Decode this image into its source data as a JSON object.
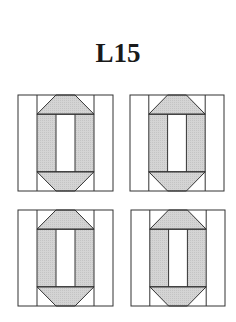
{
  "title": "L15",
  "diagram": {
    "colors": {
      "background": "#ffffff",
      "outline": "#333333",
      "fill": "#d0d0d0"
    },
    "blocks": [
      {
        "name": "block-top-left",
        "x": 18,
        "y": 95,
        "w": 95,
        "h": 96
      },
      {
        "name": "block-top-right",
        "x": 130,
        "y": 95,
        "w": 94,
        "h": 96
      },
      {
        "name": "block-bottom-left",
        "x": 18,
        "y": 210,
        "w": 95,
        "h": 96
      },
      {
        "name": "block-bottom-right",
        "x": 131,
        "y": 210,
        "w": 94,
        "h": 96
      }
    ]
  }
}
